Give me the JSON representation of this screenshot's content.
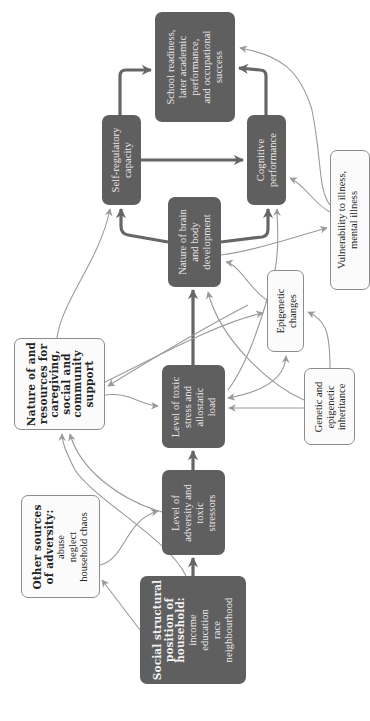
{
  "diagram": {
    "orientation": "rotated 90° counter-clockwise (text reads bottom-to-top)",
    "colors": {
      "dark_node_fill": "#5f5f5f",
      "dark_node_text": "#e8e8e8",
      "light_node_fill": "#fbfbfb",
      "light_node_border": "#8c8c8c",
      "thick_arrow": "#666666",
      "thin_arrow": "#9a9a9a"
    },
    "nodes": {
      "social_structural": {
        "title_lines": [
          "Social structural",
          "position of",
          "household:"
        ],
        "items": [
          "income",
          "education",
          "race",
          "neighbourhood"
        ]
      },
      "other_sources": {
        "title_lines": [
          "Other sources",
          "of adversity:"
        ],
        "items": [
          "abuse",
          "neglect",
          "household chaos"
        ]
      },
      "level_adversity": {
        "lines": [
          "Level of",
          "adversity and",
          "toxic",
          "stressors"
        ]
      },
      "level_toxic_stress": {
        "lines": [
          "Level of toxic",
          "stress and",
          "allostatic",
          "load"
        ]
      },
      "nature_resources": {
        "title_lines": [
          "Nature of and",
          "resources for",
          "caregiving,",
          "social and",
          "community",
          "support"
        ]
      },
      "genetic": {
        "lines": [
          "Genetic and",
          "epigenetic",
          "inheritance"
        ]
      },
      "epigenetic": {
        "lines": [
          "Epigenetic",
          "changes"
        ]
      },
      "brain_body": {
        "lines": [
          "Nature of brain",
          "and body",
          "development"
        ]
      },
      "self_regulatory": {
        "lines": [
          "Self-regulatory",
          "capacity"
        ]
      },
      "cognitive": {
        "lines": [
          "Cognitive",
          "performance"
        ]
      },
      "school_readiness": {
        "lines": [
          "School readiness,",
          "later academic",
          "performance,",
          "and occupational",
          "success"
        ]
      },
      "vulnerability": {
        "lines": [
          "Vulnerability to illness,",
          "mental illness"
        ]
      }
    },
    "edges": [
      {
        "from": "social_structural",
        "to": "level_adversity",
        "style": "thick"
      },
      {
        "from": "social_structural",
        "to": "other_sources",
        "style": "thin"
      },
      {
        "from": "social_structural",
        "to": "nature_resources",
        "style": "thin"
      },
      {
        "from": "other_sources",
        "to": "level_adversity",
        "style": "thin"
      },
      {
        "from": "level_adversity",
        "to": "level_toxic_stress",
        "style": "thick"
      },
      {
        "from": "level_adversity",
        "to": "nature_resources",
        "style": "thin"
      },
      {
        "from": "nature_resources",
        "to": "level_toxic_stress",
        "style": "thin"
      },
      {
        "from": "nature_resources",
        "to": "epigenetic",
        "style": "thin"
      },
      {
        "from": "nature_resources",
        "to": "self_regulatory",
        "style": "thin"
      },
      {
        "from": "level_toxic_stress",
        "to": "brain_body",
        "style": "thick"
      },
      {
        "from": "level_toxic_stress",
        "to": "epigenetic",
        "style": "thin",
        "bidirectional": true
      },
      {
        "from": "level_toxic_stress",
        "to": "cognitive",
        "style": "thin"
      },
      {
        "from": "genetic",
        "to": "level_toxic_stress",
        "style": "thin"
      },
      {
        "from": "genetic",
        "to": "epigenetic",
        "style": "thin"
      },
      {
        "from": "genetic",
        "to": "brain_body",
        "style": "thin"
      },
      {
        "from": "genetic",
        "to": "nature_resources",
        "style": "thin"
      },
      {
        "from": "epigenetic",
        "to": "brain_body",
        "style": "thin"
      },
      {
        "from": "brain_body",
        "to": "self_regulatory",
        "style": "thick"
      },
      {
        "from": "brain_body",
        "to": "cognitive",
        "style": "thick"
      },
      {
        "from": "brain_body",
        "to": "vulnerability",
        "style": "thin"
      },
      {
        "from": "self_regulatory",
        "to": "cognitive",
        "style": "thick"
      },
      {
        "from": "self_regulatory",
        "to": "school_readiness",
        "style": "thick"
      },
      {
        "from": "cognitive",
        "to": "school_readiness",
        "style": "thick"
      },
      {
        "from": "vulnerability",
        "to": "school_readiness",
        "style": "thin"
      },
      {
        "from": "vulnerability",
        "to": "cognitive",
        "style": "thin"
      }
    ]
  }
}
